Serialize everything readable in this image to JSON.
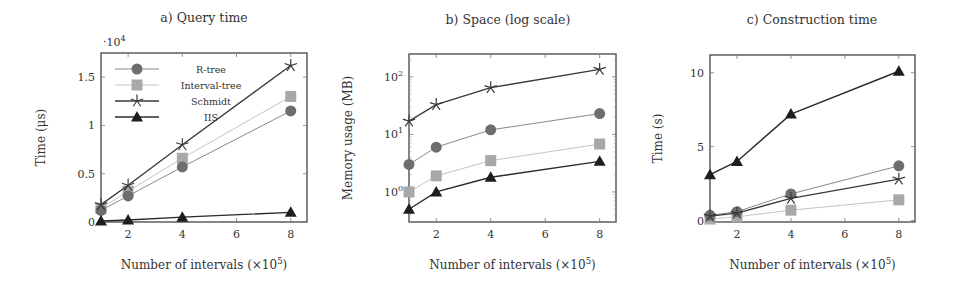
{
  "figure": {
    "series_styles": {
      "R-tree": {
        "color": "#6e6e6e",
        "line": "#8a8a8a",
        "marker": "circle",
        "width": 1
      },
      "Interval-tree": {
        "color": "#a8a8a8",
        "line": "#c4c4c4",
        "marker": "square",
        "width": 1
      },
      "Schmidt": {
        "color": "#3a3a3a",
        "line": "#3a3a3a",
        "marker": "star",
        "width": 1.4
      },
      "IIS": {
        "color": "#1e1e1e",
        "line": "#2a2a2a",
        "marker": "triangle",
        "width": 1.4
      }
    }
  },
  "chart_data": [
    {
      "id": "a",
      "type": "line",
      "title": "a) Query time",
      "xlabel": "Number of intervals (×10^5)",
      "xlabel_main": "Number of intervals (×10",
      "xlabel_exp": "5",
      "xlabel_close": ")",
      "ylabel": "Time (μs)",
      "y_multiplier": "·10^4",
      "y_multiplier_base": "·10",
      "y_multiplier_exp": "4",
      "yscale": "linear",
      "x": [
        1,
        2,
        4,
        8
      ],
      "xticks": [
        2,
        4,
        6,
        8
      ],
      "yticks": [
        0,
        0.5,
        1,
        1.5
      ],
      "ytick_labels": [
        "0",
        "0.5",
        "1",
        "1.5"
      ],
      "xlim": [
        1,
        8.6
      ],
      "ylim": [
        0,
        1.75
      ],
      "legend": {
        "position": "upper left",
        "entries": [
          "R-tree",
          "Interval-tree",
          "Schmidt",
          "IIS"
        ]
      },
      "series": [
        {
          "name": "R-tree",
          "values": [
            0.12,
            0.27,
            0.57,
            1.15
          ]
        },
        {
          "name": "Interval-tree",
          "values": [
            0.14,
            0.32,
            0.66,
            1.3
          ]
        },
        {
          "name": "Schmidt",
          "values": [
            0.18,
            0.38,
            0.8,
            1.62
          ]
        },
        {
          "name": "IIS",
          "values": [
            0.01,
            0.02,
            0.05,
            0.1
          ]
        }
      ]
    },
    {
      "id": "b",
      "type": "line",
      "title": "b) Space (log scale)",
      "xlabel": "Number of intervals (×10^5)",
      "xlabel_main": "Number of intervals (×10",
      "xlabel_exp": "5",
      "xlabel_close": ")",
      "ylabel": "Memory usage (MB)",
      "yscale": "log",
      "x": [
        1,
        2,
        4,
        8
      ],
      "xticks": [
        2,
        4,
        6,
        8
      ],
      "yticks": [
        1,
        10,
        100
      ],
      "ytick_labels": [
        {
          "base": "10",
          "exp": "0"
        },
        {
          "base": "10",
          "exp": "1"
        },
        {
          "base": "10",
          "exp": "2"
        }
      ],
      "xlim": [
        1,
        8.6
      ],
      "ylim": [
        0.3,
        250
      ],
      "series": [
        {
          "name": "R-tree",
          "values": [
            3.0,
            6.0,
            12.0,
            23.0
          ]
        },
        {
          "name": "Interval-tree",
          "values": [
            1.0,
            1.9,
            3.5,
            6.8
          ]
        },
        {
          "name": "Schmidt",
          "values": [
            17,
            33,
            65,
            135
          ]
        },
        {
          "name": "IIS",
          "values": [
            0.5,
            1.0,
            1.8,
            3.4
          ]
        }
      ]
    },
    {
      "id": "c",
      "type": "line",
      "title": "c) Construction time",
      "xlabel": "Number of intervals (×10^5)",
      "xlabel_main": "Number of intervals (×10",
      "xlabel_exp": "5",
      "xlabel_close": ")",
      "ylabel": "Time (s)",
      "yscale": "linear",
      "x": [
        1,
        2,
        4,
        8
      ],
      "xticks": [
        2,
        4,
        6,
        8
      ],
      "yticks": [
        0,
        5,
        10
      ],
      "ytick_labels": [
        "0",
        "5",
        "10"
      ],
      "xlim": [
        1,
        8.6
      ],
      "ylim": [
        -0.1,
        11.2
      ],
      "series": [
        {
          "name": "R-tree",
          "values": [
            0.35,
            0.6,
            1.8,
            3.7
          ]
        },
        {
          "name": "Interval-tree",
          "values": [
            0.1,
            0.25,
            0.7,
            1.4
          ]
        },
        {
          "name": "Schmidt",
          "values": [
            0.3,
            0.5,
            1.5,
            2.8
          ]
        },
        {
          "name": "IIS",
          "values": [
            3.1,
            4.0,
            7.2,
            10.1
          ]
        }
      ]
    }
  ]
}
